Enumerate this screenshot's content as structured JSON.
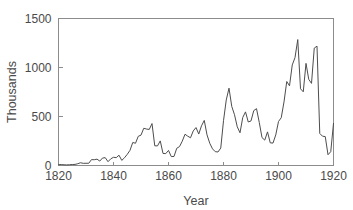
{
  "chart_data": {
    "type": "line",
    "title": "",
    "subtitle": "",
    "xlabel": "Year",
    "ylabel": "Thousands",
    "xlim": [
      1820,
      1920
    ],
    "ylim": [
      0,
      1500
    ],
    "xticks": [
      1820,
      1840,
      1860,
      1880,
      1900,
      1920
    ],
    "yticks": [
      0,
      500,
      1000,
      1500
    ],
    "xtick_labels": [
      "1820",
      "1840",
      "1860",
      "1880",
      "1900",
      "1920"
    ],
    "ytick_labels": [
      "0",
      "500",
      "1000",
      "1500"
    ],
    "grid": false,
    "legend": false,
    "legend_position": "none",
    "line_color": "#4d4d4d",
    "axis_color": "#8c8c8c",
    "series": [
      {
        "name": "Immigration",
        "x": [
          1820,
          1821,
          1822,
          1823,
          1824,
          1825,
          1826,
          1827,
          1828,
          1829,
          1830,
          1831,
          1832,
          1833,
          1834,
          1835,
          1836,
          1837,
          1838,
          1839,
          1840,
          1841,
          1842,
          1843,
          1844,
          1845,
          1846,
          1847,
          1848,
          1849,
          1850,
          1851,
          1852,
          1853,
          1854,
          1855,
          1856,
          1857,
          1858,
          1859,
          1860,
          1861,
          1862,
          1863,
          1864,
          1865,
          1866,
          1867,
          1868,
          1869,
          1870,
          1871,
          1872,
          1873,
          1874,
          1875,
          1876,
          1877,
          1878,
          1879,
          1880,
          1881,
          1882,
          1883,
          1884,
          1885,
          1886,
          1887,
          1888,
          1889,
          1890,
          1891,
          1892,
          1893,
          1894,
          1895,
          1896,
          1897,
          1898,
          1899,
          1900,
          1901,
          1902,
          1903,
          1904,
          1905,
          1906,
          1907,
          1908,
          1909,
          1910,
          1911,
          1912,
          1913,
          1914,
          1915,
          1916,
          1917,
          1918,
          1919,
          1920
        ],
        "values": [
          8,
          10,
          7,
          6,
          8,
          10,
          11,
          18,
          28,
          22,
          23,
          23,
          60,
          59,
          65,
          45,
          76,
          80,
          39,
          68,
          84,
          80,
          105,
          52,
          79,
          114,
          155,
          235,
          227,
          298,
          310,
          380,
          372,
          368,
          428,
          201,
          200,
          251,
          123,
          121,
          154,
          91,
          92,
          176,
          193,
          248,
          319,
          299,
          283,
          353,
          387,
          321,
          405,
          460,
          313,
          227,
          170,
          141,
          138,
          178,
          457,
          669,
          789,
          603,
          518,
          395,
          334,
          490,
          547,
          444,
          455,
          560,
          580,
          440,
          285,
          259,
          343,
          231,
          229,
          312,
          449,
          488,
          649,
          857,
          813,
          1026,
          1101,
          1285,
          783,
          752,
          1042,
          879,
          838,
          1198,
          1218,
          327,
          299,
          295,
          110,
          141,
          430
        ],
        "color": "#4d4d4d"
      }
    ]
  }
}
